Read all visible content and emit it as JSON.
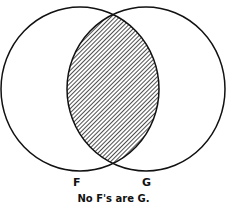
{
  "diagram": {
    "type": "venn",
    "sets": [
      {
        "name": "F",
        "label": "F"
      },
      {
        "name": "G",
        "label": "G"
      }
    ],
    "shaded_region": "intersection F∩G",
    "caption": "No F's are G.",
    "colors": {
      "stroke": "#111111",
      "hatch": "#222222",
      "background": "#ffffff"
    }
  }
}
